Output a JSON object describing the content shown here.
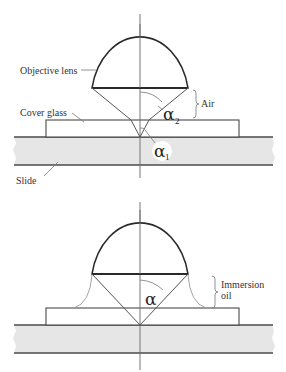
{
  "figure": {
    "top_panel": {
      "name": "dry-objective",
      "labels": {
        "objective_lens": "Objective lens",
        "cover_glass": "Cover glass",
        "slide": "Slide",
        "air": "Air",
        "alpha_2": "α",
        "alpha_2_sub": "2",
        "alpha_1": "α",
        "alpha_1_sub": "1"
      }
    },
    "bottom_panel": {
      "name": "oil-immersion-objective",
      "labels": {
        "immersion_line1": "Immersion",
        "immersion_line2": "oil",
        "alpha": "α"
      }
    },
    "colors": {
      "slide_fill": "#e6e6e6",
      "line": "#2a2a2a",
      "background": "#ffffff"
    }
  }
}
